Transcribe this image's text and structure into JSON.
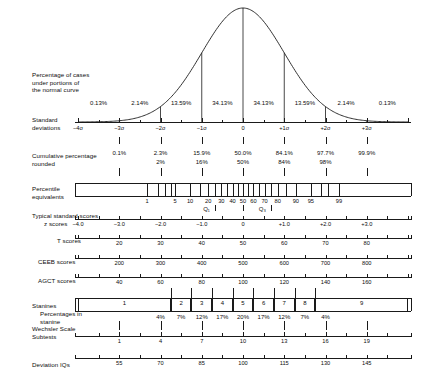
{
  "rows": {
    "pct_cases": "Percentage of cases\nunder portions of\nthe normal curve",
    "std_dev": "Standard\ndeviations",
    "cum_pct": "Cumulative percentage\nrounded",
    "percentile": "Percentile\nequivalents",
    "typical": "Typical standard scores",
    "z": "z scores",
    "t": "T scores",
    "ceeb": "CEEB scores",
    "agct": "AGCT scores",
    "stanines": "Stanines",
    "stanine_pct": "Percentages in\nstanine",
    "wechsler": "Wechsler Scale\nSubtests",
    "deviation_iq": "Deviation IQs"
  },
  "chart_data": {
    "type": "line",
    "xlabel": "Standard deviations",
    "ylabel": "Relative frequency",
    "xlim": [
      -4,
      4
    ],
    "grid": false,
    "legend": "none",
    "curve": {
      "name": "normal curve",
      "mean": 0,
      "sd": 1,
      "marker_sigmas": [
        -3,
        -2,
        -1,
        0,
        1,
        2,
        3
      ]
    },
    "percentage_of_cases": {
      "bins": [
        "-4σ to -3σ",
        "-3σ to -2σ",
        "-2σ to -1σ",
        "-1σ to 0",
        "0 to +1σ",
        "+1σ to +2σ",
        "+2σ to +3σ",
        "+3σ to +4σ"
      ],
      "centers": [
        -3.5,
        -2.5,
        -1.5,
        -0.5,
        0.5,
        1.5,
        2.5,
        3.5
      ],
      "labels": [
        "0.13%",
        "2.14%",
        "13.59%",
        "34.13%",
        "34.13%",
        "13.59%",
        "2.14%",
        "0.13%"
      ]
    },
    "standard_deviations": {
      "positions": [
        -4,
        -3,
        -2,
        -1,
        0,
        1,
        2,
        3
      ],
      "labels": [
        "−4σ",
        "−3σ",
        "−2σ",
        "−1σ",
        "0",
        "+1σ",
        "+2σ",
        "+3σ"
      ]
    },
    "cumulative_percentage": {
      "positions": [
        -3,
        -2,
        -1,
        0,
        1,
        2,
        3
      ],
      "exact": [
        "0.1%",
        "2.3%",
        "15.9%",
        "50.0%",
        "84.1%",
        "97.7%",
        "99.9%"
      ],
      "rounded": [
        "",
        "2%",
        "16%",
        "50%",
        "84%",
        "98%",
        ""
      ]
    },
    "percentile_equivalents": {
      "labels": [
        "1",
        "5",
        "10",
        "20",
        "30",
        "40",
        "50",
        "60",
        "70",
        "80",
        "90",
        "95",
        "99"
      ],
      "percentiles": [
        1,
        5,
        10,
        20,
        30,
        40,
        50,
        60,
        70,
        80,
        90,
        95,
        99
      ],
      "z_positions": [
        -2.326,
        -1.645,
        -1.282,
        -0.842,
        -0.524,
        -0.253,
        0,
        0.253,
        0.524,
        0.842,
        1.282,
        1.645,
        2.326
      ],
      "quartile_markers": [
        {
          "label": "Q₁",
          "percentile": 25,
          "z": -0.674
        },
        {
          "label": "Md",
          "percentile": 50,
          "z": 0
        },
        {
          "label": "Q₃",
          "percentile": 75,
          "z": 0.674
        }
      ]
    },
    "z_scores": {
      "positions": [
        -4,
        -3,
        -2,
        -1,
        0,
        1,
        2,
        3
      ],
      "labels": [
        "−4.0",
        "−3.0",
        "−2.0",
        "−1.0",
        "0",
        "+1.0",
        "+2.0",
        "+3.0"
      ]
    },
    "T_scores": {
      "positions": [
        -3,
        -2,
        -1,
        0,
        1,
        2,
        3
      ],
      "labels": [
        "20",
        "30",
        "40",
        "50",
        "60",
        "70",
        "80"
      ],
      "mean": 50,
      "sd": 10
    },
    "CEEB_scores": {
      "positions": [
        -3,
        -2,
        -1,
        0,
        1,
        2,
        3
      ],
      "labels": [
        "200",
        "300",
        "400",
        "500",
        "600",
        "700",
        "800"
      ],
      "mean": 500,
      "sd": 100
    },
    "AGCT_scores": {
      "positions": [
        -3,
        -2,
        -1,
        0,
        1,
        2,
        3
      ],
      "labels": [
        "40",
        "60",
        "80",
        "100",
        "120",
        "140",
        "160"
      ],
      "mean": 100,
      "sd": 20
    },
    "stanines": {
      "labels": [
        "1",
        "2",
        "3",
        "4",
        "5",
        "6",
        "7",
        "8",
        "9"
      ],
      "boundaries_z": [
        -4,
        -1.75,
        -1.25,
        -0.75,
        -0.25,
        0.25,
        0.75,
        1.25,
        1.75,
        4
      ],
      "percentages": [
        "4%",
        "7%",
        "12%",
        "17%",
        "20%",
        "17%",
        "12%",
        "7%",
        "4%"
      ],
      "percentage_centers_z": [
        -2.0,
        -1.5,
        -1.0,
        -0.5,
        0.0,
        0.5,
        1.0,
        1.5,
        2.0
      ]
    },
    "wechsler_subtests": {
      "positions": [
        -3,
        -2,
        -1,
        0,
        1,
        2,
        3
      ],
      "labels": [
        "1",
        "4",
        "7",
        "10",
        "13",
        "16",
        "19"
      ],
      "mean": 10,
      "sd": 3
    },
    "deviation_iqs": {
      "positions": [
        -3,
        -2,
        -1,
        0,
        1,
        2,
        3
      ],
      "labels": [
        "55",
        "70",
        "85",
        "100",
        "115",
        "130",
        "145"
      ],
      "mean": 100,
      "sd": 15
    }
  }
}
